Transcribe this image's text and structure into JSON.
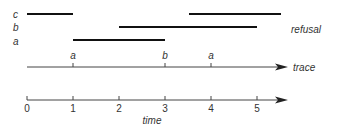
{
  "diagram": {
    "row_labels": [
      "c",
      "b",
      "a"
    ],
    "refusal_label": "refusal",
    "trace_label": "trace",
    "time_label": "time",
    "trace_events": [
      {
        "label": "a",
        "t": 1
      },
      {
        "label": "b",
        "t": 3
      },
      {
        "label": "a",
        "t": 4
      }
    ],
    "time_ticks": [
      "0",
      "1",
      "2",
      "3",
      "4",
      "5"
    ],
    "refusal_intervals": {
      "c": [
        [
          0,
          1
        ],
        [
          3.5,
          5.5
        ]
      ],
      "b": [
        [
          2,
          5
        ]
      ],
      "a": [
        [
          1,
          3
        ]
      ]
    },
    "colors": {
      "bar": "#111111",
      "axis": "#444444",
      "text": "#333333"
    }
  }
}
